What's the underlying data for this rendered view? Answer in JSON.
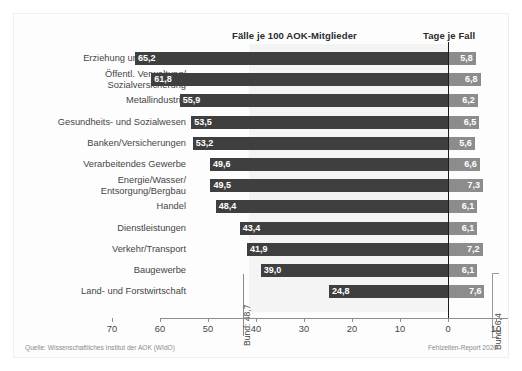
{
  "header": {
    "left_title": "Fälle je 100 AOK-Mitglieder",
    "right_title": "Tage je Fall"
  },
  "footer": {
    "source": "Quelle: Wissenschaftliches Institut der AOK (WIdO)",
    "report": "Fehlzeiten-Report 2020"
  },
  "annotations": {
    "bund_left": "Bund: 48,7",
    "bund_right": "Bund: 6,4"
  },
  "chart_data": {
    "type": "bar",
    "title": "",
    "orientation": "horizontal",
    "grid": false,
    "legend": false,
    "xlabel": "",
    "ylabel": "",
    "categories": [
      "Erziehung und Unterricht",
      "Öffentl. Verwaltung/\nSozialversicherung",
      "Metallindustrie",
      "Gesundheits- und Sozialwesen",
      "Banken/Versicherungen",
      "Verarbeitendes Gewerbe",
      "Energie/Wasser/\nEntsorgung/Bergbau",
      "Handel",
      "Dienstleistungen",
      "Verkehr/Transport",
      "Baugewerbe",
      "Land- und Forstwirtschaft"
    ],
    "series": [
      {
        "name": "Fälle je 100 AOK-Mitglieder",
        "color": "#3f3f3f",
        "direction": "left",
        "axis_range": [
          0,
          70
        ],
        "values": [
          65.2,
          61.8,
          55.9,
          53.5,
          53.2,
          49.6,
          49.5,
          48.4,
          43.4,
          41.9,
          39.0,
          24.8
        ],
        "labels": [
          "65,2",
          "61,8",
          "55,9",
          "53,5",
          "53,2",
          "49,6",
          "49,5",
          "48,4",
          "43,4",
          "41,9",
          "39,0",
          "24,8"
        ],
        "reference_line": {
          "label": "Bund: 48,7",
          "value": 48.7
        }
      },
      {
        "name": "Tage je Fall",
        "color": "#8c8c8c",
        "direction": "right",
        "axis_range": [
          0,
          10
        ],
        "values": [
          5.8,
          6.8,
          6.2,
          6.5,
          5.6,
          6.6,
          7.3,
          6.1,
          6.1,
          7.2,
          6.1,
          7.6
        ],
        "labels": [
          "5,8",
          "6,8",
          "6,2",
          "6,5",
          "5,6",
          "6,6",
          "7,3",
          "6,1",
          "6,1",
          "7,2",
          "6,1",
          "7,6"
        ],
        "reference_line": {
          "label": "Bund: 6,4",
          "value": 6.4
        }
      }
    ],
    "axis_ticks": [
      {
        "label": "70",
        "value": 70,
        "side": "left"
      },
      {
        "label": "60",
        "value": 60,
        "side": "left"
      },
      {
        "label": "50",
        "value": 50,
        "side": "left"
      },
      {
        "label": "40",
        "value": 40,
        "side": "left"
      },
      {
        "label": "30",
        "value": 30,
        "side": "left"
      },
      {
        "label": "20",
        "value": 20,
        "side": "left"
      },
      {
        "label": "10",
        "value": 10,
        "side": "left"
      },
      {
        "label": "0",
        "value": 0,
        "side": "center"
      },
      {
        "label": "10",
        "value": 10,
        "side": "right"
      }
    ]
  }
}
